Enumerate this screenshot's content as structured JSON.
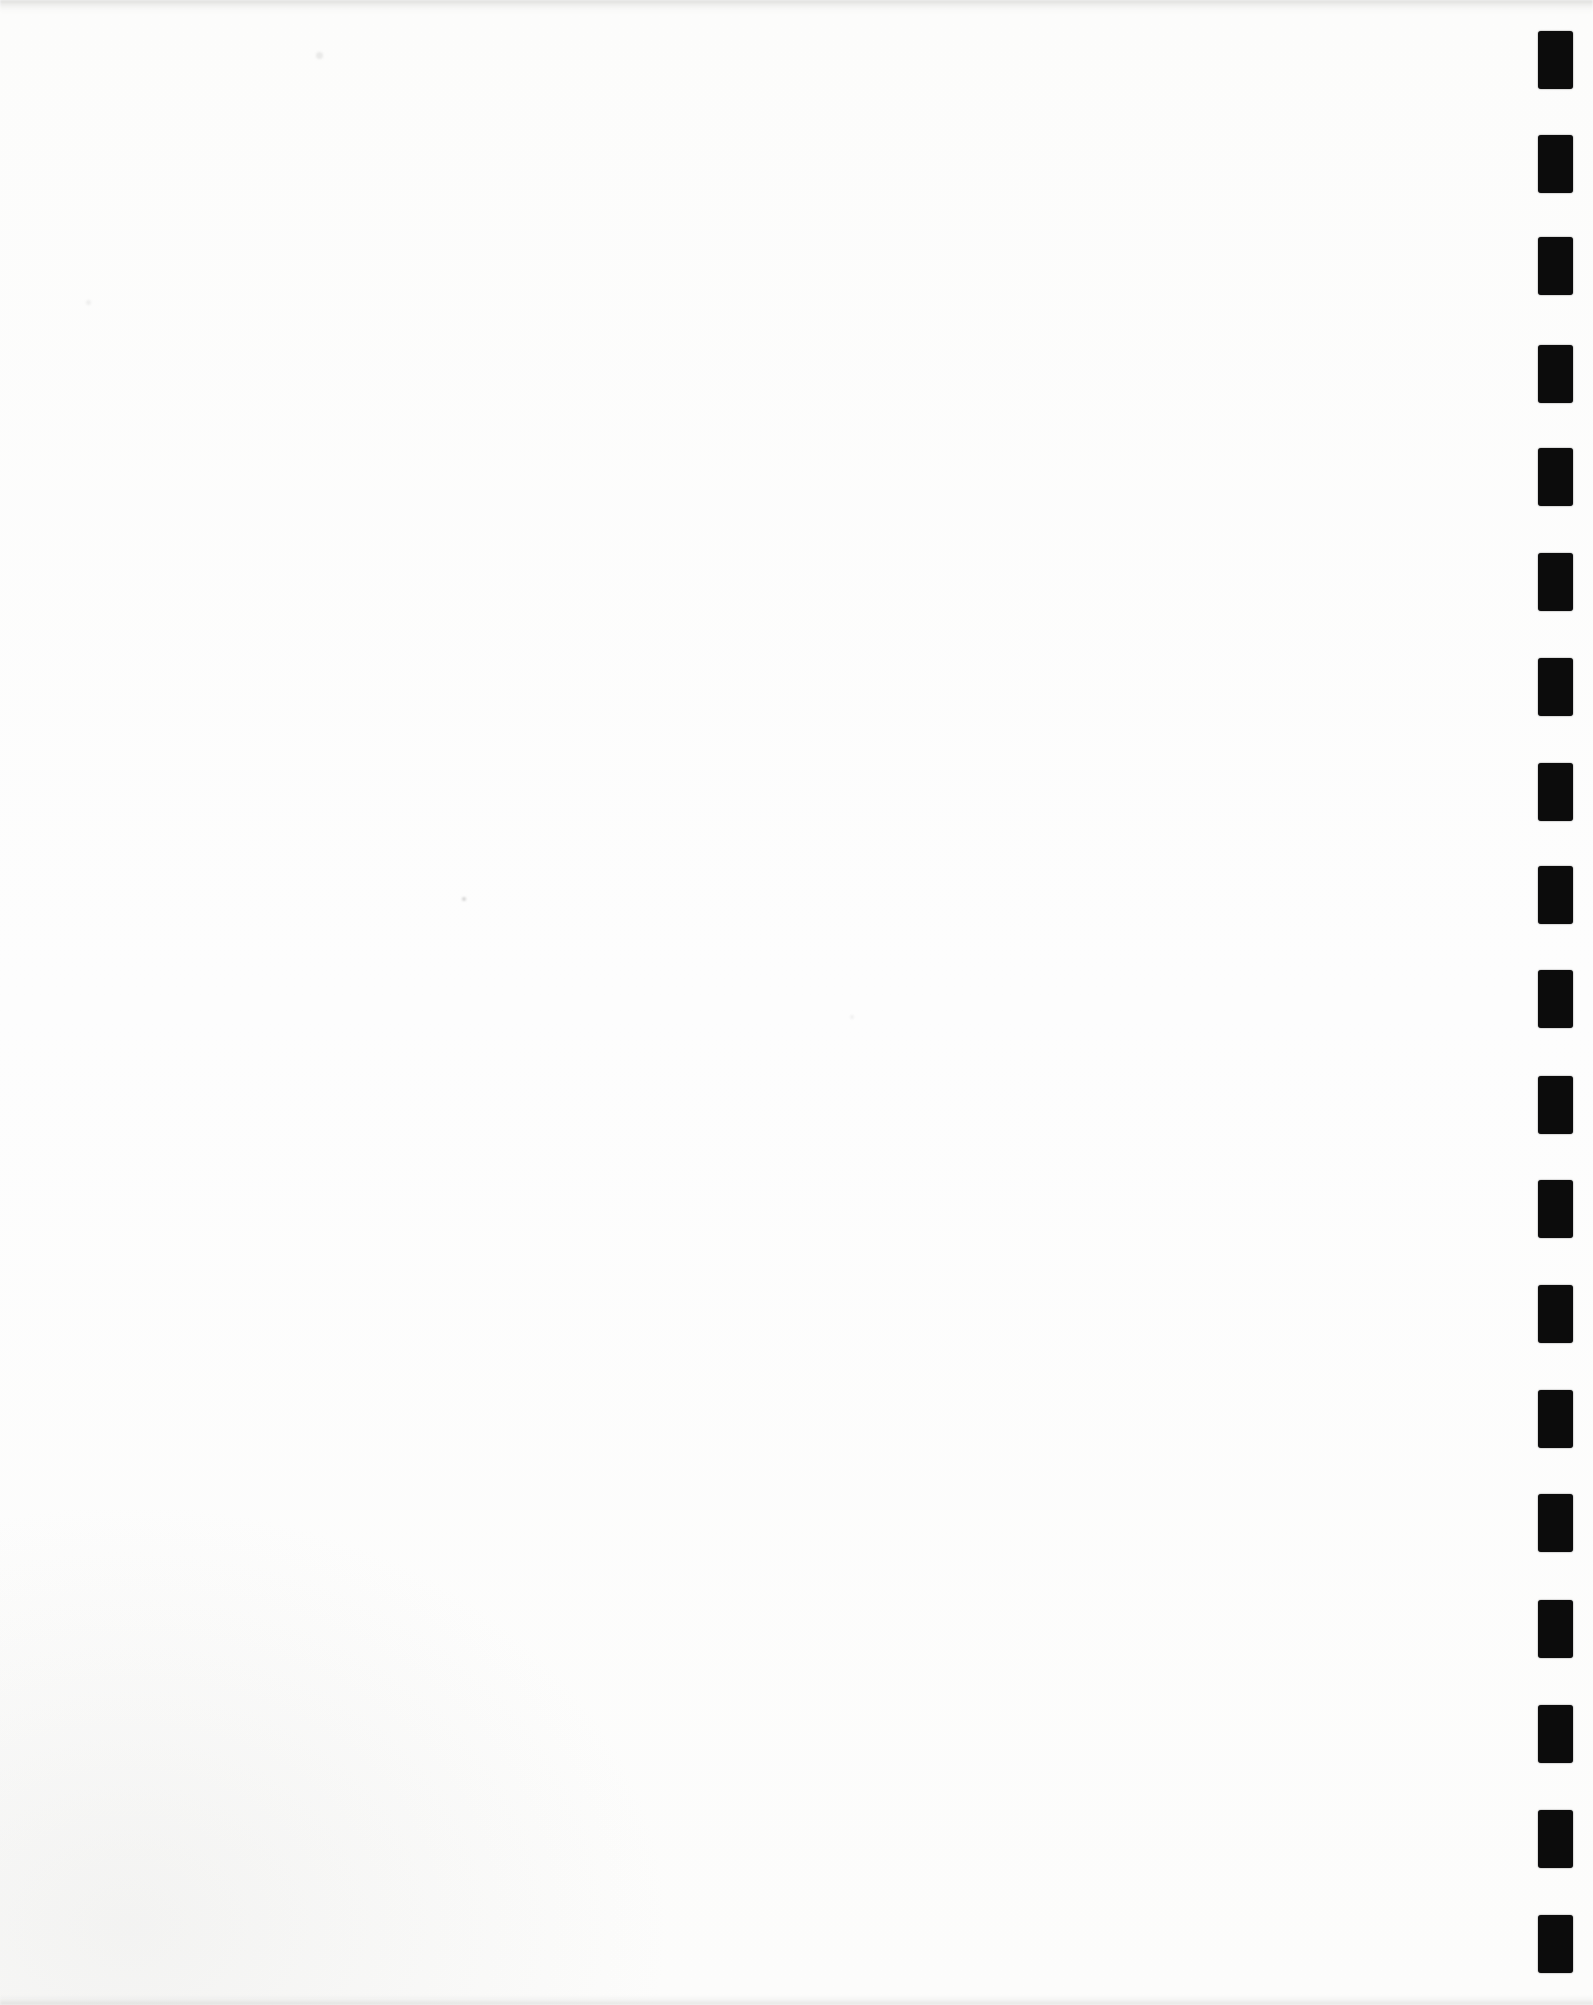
{
  "page": {
    "kind": "scanned-blank-page",
    "width": 1593,
    "height": 2005,
    "background_color": "#fdfdfd",
    "text_content": ""
  },
  "punch_marks": {
    "description": "column of solid black rectangular scan marks along right edge",
    "color": "#0c0c0c",
    "left": 1538,
    "width": 35,
    "height": 58,
    "count": 19,
    "tops": [
      31,
      135,
      237,
      345,
      448,
      553,
      658,
      763,
      866,
      970,
      1076,
      1180,
      1285,
      1390,
      1494,
      1600,
      1705,
      1810,
      1915
    ]
  },
  "artifacts": {
    "specks": [
      {
        "x": 316,
        "y": 52,
        "size": 7,
        "color": "rgba(150,150,148,0.18)"
      },
      {
        "x": 462,
        "y": 897,
        "size": 4,
        "color": "rgba(120,120,118,0.30)"
      },
      {
        "x": 86,
        "y": 300,
        "size": 5,
        "color": "rgba(160,160,158,0.15)"
      },
      {
        "x": 850,
        "y": 1015,
        "size": 4,
        "color": "rgba(160,160,158,0.15)"
      }
    ]
  }
}
